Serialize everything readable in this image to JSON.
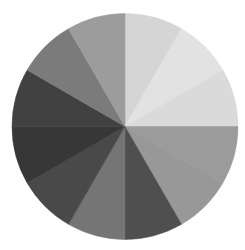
{
  "chart_data": {
    "type": "pie",
    "title": "",
    "legend": null,
    "start_angle_deg": 0,
    "direction": "clockwise",
    "center": [
      125,
      126.5
    ],
    "radius": 113,
    "categories": [
      "S1",
      "S2",
      "S3",
      "S4",
      "S5",
      "S6",
      "S7",
      "S8",
      "S9",
      "S10",
      "S11",
      "S12"
    ],
    "values": [
      30,
      30,
      30,
      30,
      30,
      30,
      30,
      30,
      30,
      30,
      30,
      30
    ],
    "colors": [
      "#d5d5d5",
      "#e2e2e2",
      "#dadada",
      "#9b9b9b",
      "#989898",
      "#4f4f4f",
      "#757575",
      "#494949",
      "#373737",
      "#414141",
      "#7b7b7b",
      "#9c9c9c"
    ],
    "labels_visible": false
  }
}
